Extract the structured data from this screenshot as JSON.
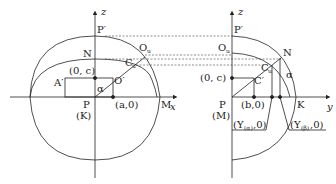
{
  "left_diagram": {
    "axis_z_label": "z",
    "axis_x_label": "x",
    "points": {
      "P_prime": "P′",
      "N": "N",
      "O_u": "O",
      "O_u_sub": "u",
      "C_u": "C",
      "C_u_sub": "u",
      "A_prime": "A′",
      "O_prime": "O′",
      "P": "P",
      "K": "(K)",
      "M": "M",
      "alpha": "α"
    },
    "coords": {
      "zero_c": "(0, c)",
      "a_zero": "(a,0)"
    }
  },
  "right_diagram": {
    "axis_z_label": "z",
    "axis_y_label": "y",
    "points": {
      "P_prime": "P′",
      "O_u": "O",
      "O_u_sub": "u",
      "N": "N",
      "C_u": "C",
      "C_u_sub": "u",
      "C_prime": "C′",
      "alpha": "α",
      "P": "P",
      "M": "(M)",
      "K": "K"
    },
    "coords": {
      "zero_c": "(0, c)",
      "b_zero": "(b,0)",
      "y_alpha": "(Y",
      "y_alpha_sub": "(α)",
      "y_alpha_tail": ",0)",
      "y_beta": "(Y",
      "y_beta_sub": "(β)",
      "y_beta_tail": ",0)"
    }
  }
}
